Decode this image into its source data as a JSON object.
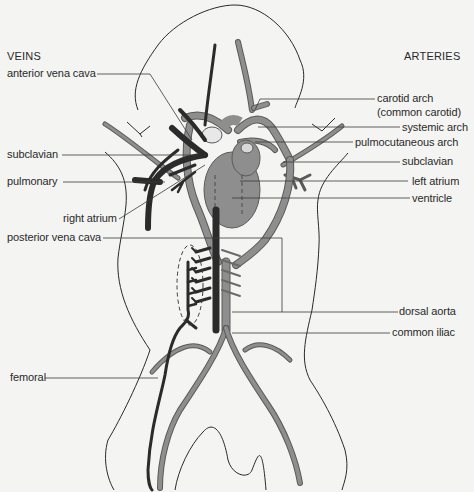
{
  "headings": {
    "left": "VEINS",
    "right": "ARTERIES"
  },
  "veins": [
    {
      "label": "anterior vena cava"
    },
    {
      "label": "subclavian"
    },
    {
      "label": "pulmonary"
    },
    {
      "label": "right atrium"
    },
    {
      "label": "posterior vena cava"
    },
    {
      "label": "femoral"
    }
  ],
  "arteries": [
    {
      "label": "carotid arch"
    },
    {
      "label": "(common carotid)"
    },
    {
      "label": "systemic arch"
    },
    {
      "label": "pulmocutaneous arch"
    },
    {
      "label": "subclavian"
    },
    {
      "label": "left atrium"
    },
    {
      "label": "ventricle"
    },
    {
      "label": "dorsal aorta"
    },
    {
      "label": "common iliac"
    }
  ],
  "colors": {
    "background": "#f4f4f2",
    "outline": "#2a2a2a",
    "vein": "#2b2b2b",
    "artery": "#8e8e8e",
    "artery_edge": "#5a5a5a",
    "heart": "#8e8e8e",
    "leader": "#3a3a3a"
  }
}
